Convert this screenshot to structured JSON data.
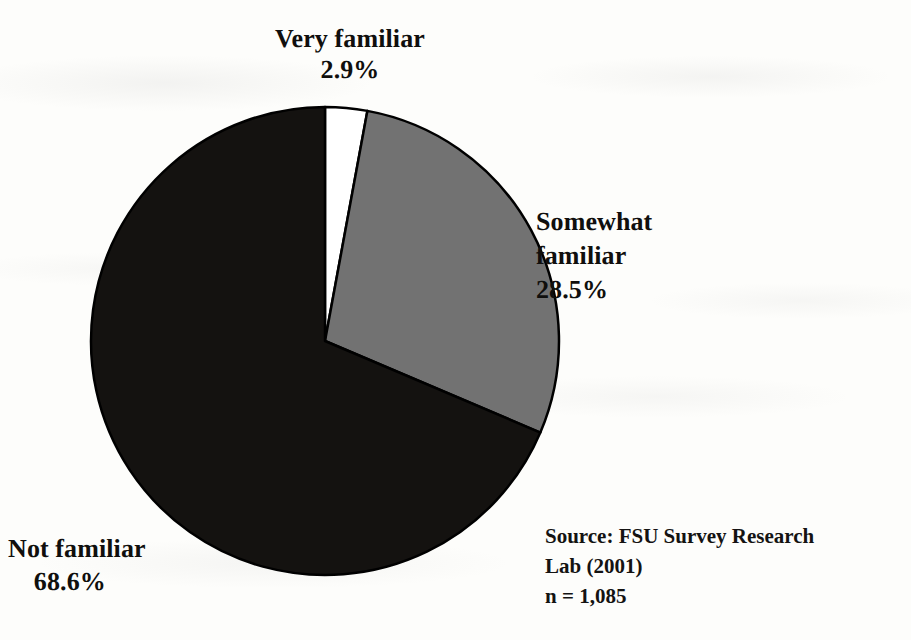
{
  "figure": {
    "background_color": "#fdfdfb",
    "ink_color": "#100f0d"
  },
  "chart_data": {
    "type": "pie",
    "title": "",
    "subtitle": "",
    "xlabel": "",
    "ylabel": "",
    "legend_position": "none",
    "grid": false,
    "start_angle_deg": 0,
    "direction": "clockwise",
    "categories": [
      "Very familiar",
      "Somewhat familiar",
      "Not familiar"
    ],
    "values": [
      2.9,
      28.5,
      68.6
    ],
    "value_unit": "%",
    "colors": [
      "#ffffff",
      "#727272",
      "#141210"
    ],
    "slice_edge_color": "#000000",
    "slices": [
      {
        "label": "Very familiar",
        "value": 2.9,
        "value_label": "2.9%",
        "color": "#ffffff",
        "label_position": "top"
      },
      {
        "label_line1": "Somewhat",
        "label_line2": "familiar",
        "label": "Somewhat familiar",
        "value": 28.5,
        "value_label": "28.5%",
        "color": "#727272",
        "label_position": "right"
      },
      {
        "label": "Not familiar",
        "value": 68.6,
        "value_label": "68.6%",
        "color": "#141210",
        "label_position": "bottom-left"
      }
    ],
    "annotations": [
      "Source: FSU Survey Research",
      "Lab (2001)",
      "n = 1,085"
    ],
    "sample_size": 1085,
    "sample_size_label": "n = 1,085"
  },
  "labels": {
    "very_familiar": {
      "name": "Very familiar",
      "percent": "2.9%"
    },
    "somewhat_familiar": {
      "line1": "Somewhat",
      "line2": "familiar",
      "percent": "28.5%"
    },
    "not_familiar": {
      "name": "Not familiar",
      "percent": "68.6%"
    }
  },
  "source_note": {
    "line1": "Source: FSU Survey Research",
    "line2": "Lab (2001)",
    "line3": "n = 1,085"
  }
}
